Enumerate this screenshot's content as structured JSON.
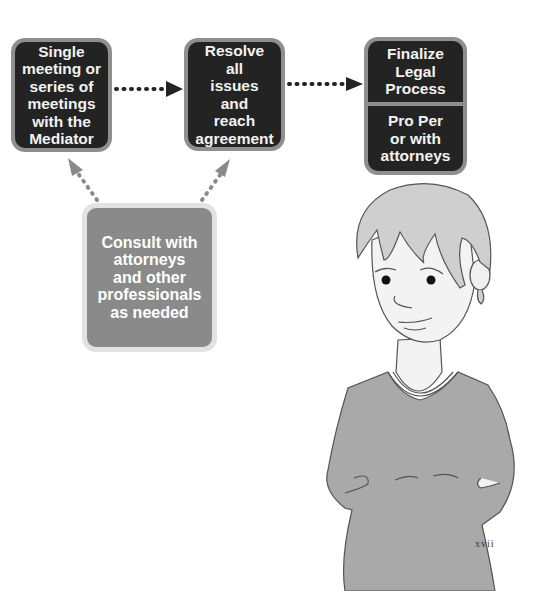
{
  "diagram": {
    "nodes": [
      {
        "id": "b1",
        "lines": [
          "Single",
          "meeting or",
          "series of",
          "meetings",
          "with the",
          "Mediator"
        ],
        "fill": "#232323"
      },
      {
        "id": "b2",
        "lines": [
          "Resolve",
          "all",
          "issues",
          "and",
          "reach",
          "agreement"
        ],
        "fill": "#232323"
      },
      {
        "id": "b3",
        "top_lines": [
          "Finalize",
          "Legal",
          "Process"
        ],
        "bottom_lines": [
          "Pro Per",
          "or with",
          "attorneys"
        ],
        "fill": "#232323"
      },
      {
        "id": "b4",
        "lines": [
          "Consult with",
          "attorneys",
          "and other",
          "professionals",
          "as needed"
        ],
        "fill": "#8a8a8a"
      }
    ],
    "edges": [
      {
        "from": "b1",
        "to": "b2",
        "style": "dotted",
        "color": "#232323"
      },
      {
        "from": "b2",
        "to": "b3",
        "style": "dotted",
        "color": "#232323"
      },
      {
        "from": "b4",
        "to": "b1",
        "style": "dotted",
        "color": "#8a8a8a"
      },
      {
        "from": "b4",
        "to": "b2",
        "style": "dotted",
        "color": "#8a8a8a"
      }
    ]
  },
  "illustration": {
    "subject": "woman-with-hands-on-hips",
    "shirt_color": "#a9a9a9",
    "hair_color": "#cfcfcf"
  },
  "page_number": "xvii"
}
